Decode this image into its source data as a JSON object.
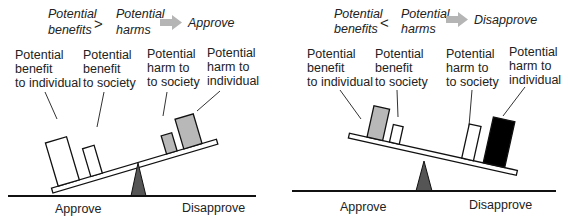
{
  "panels": [
    {
      "id": "approve-panel",
      "equation": {
        "left": [
          "Potential",
          "benefits"
        ],
        "operator": ">",
        "right": [
          "Potential",
          "harms"
        ],
        "arrow_icon": "right-arrow-icon",
        "outcome": "Approve"
      },
      "items": [
        {
          "label": [
            "Potential",
            "benefit",
            "to individual"
          ],
          "fill": "#ffffff"
        },
        {
          "label": [
            "Potential",
            "benefit",
            "to society"
          ],
          "fill": "#ffffff"
        },
        {
          "label": [
            "Potential",
            "harm to",
            "to society"
          ],
          "fill": "#b8b8b8"
        },
        {
          "label": [
            "Potential",
            "harm to",
            "individual"
          ],
          "fill": "#b8b8b8"
        }
      ],
      "ground_labels": {
        "left": "Approve",
        "right": "Disapprove"
      }
    },
    {
      "id": "disapprove-panel",
      "equation": {
        "left": [
          "Potential",
          "benefits"
        ],
        "operator": "<",
        "right": [
          "Potential",
          "harms"
        ],
        "arrow_icon": "right-arrow-icon",
        "outcome": "Disapprove"
      },
      "items": [
        {
          "label": [
            "Potential",
            "benefit",
            "to individual"
          ],
          "fill": "#b8b8b8"
        },
        {
          "label": [
            "Potential",
            "benefit",
            "to society"
          ],
          "fill": "#ffffff"
        },
        {
          "label": [
            "Potential",
            "harm to",
            "to society"
          ],
          "fill": "#ffffff"
        },
        {
          "label": [
            "Potential",
            "harm to",
            "individual"
          ],
          "fill": "#000000"
        }
      ],
      "ground_labels": {
        "left": "Approve",
        "right": "Disapprove"
      }
    }
  ],
  "colors": {
    "arrow": "#b5b5b5",
    "fulcrum": "#555555",
    "line": "#111111"
  }
}
